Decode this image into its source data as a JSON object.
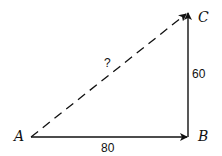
{
  "diagram": {
    "type": "vector-right-triangle",
    "points": {
      "A": {
        "label": "A"
      },
      "B": {
        "label": "B"
      },
      "C": {
        "label": "C"
      }
    },
    "edges": {
      "AB": {
        "label": "80",
        "style": "solid-arrow"
      },
      "BC": {
        "label": "60",
        "style": "solid-arrow"
      },
      "AC": {
        "label": "?",
        "style": "dashed-arrow"
      }
    },
    "colors": {
      "line": "#111111",
      "background": "#ffffff"
    }
  }
}
